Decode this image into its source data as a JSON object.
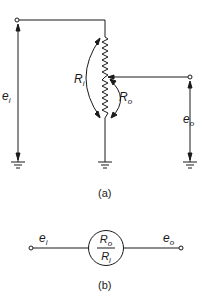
{
  "diagram": {
    "type": "potentiometer-circuit",
    "part_a": {
      "caption": "(a)",
      "labels": {
        "input_voltage": {
          "main": "e",
          "sub": "i"
        },
        "output_voltage": {
          "main": "e",
          "sub": "o"
        },
        "input_resistance": {
          "main": "R",
          "sub": "i"
        },
        "output_resistance": {
          "main": "R",
          "sub": "o"
        }
      }
    },
    "part_b": {
      "caption": "(b)",
      "labels": {
        "input": {
          "main": "e",
          "sub": "i"
        },
        "output": {
          "main": "e",
          "sub": "o"
        },
        "numerator": {
          "main": "R",
          "sub": "o"
        },
        "denominator": {
          "main": "R",
          "sub": "i"
        }
      }
    },
    "colors": {
      "ink": "#1a1a1a",
      "background": "#ffffff"
    }
  }
}
